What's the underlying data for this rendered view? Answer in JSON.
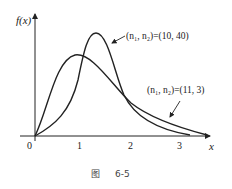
{
  "figure": {
    "y_axis_label": "f(x)",
    "x_axis_label": "x",
    "x_ticks": [
      "0",
      "1",
      "2",
      "3"
    ],
    "caption_prefix": "图",
    "caption_number": "6-5"
  },
  "annotations": [
    {
      "text": "(n₁, n₂)=(10, 40)",
      "target_curve": "f-dist-10-40"
    },
    {
      "text": "(n₁, n₂)=(11, 3)",
      "target_curve": "f-dist-11-3"
    }
  ],
  "curves": [
    {
      "name": "f-dist-10-40",
      "n1": 10,
      "n2": 40,
      "peak_x_approx": 1.2
    },
    {
      "name": "f-dist-11-3",
      "n1": 11,
      "n2": 3,
      "peak_x_approx": 0.8
    }
  ],
  "colors": {
    "line": "#222222",
    "background": "#ffffff"
  }
}
